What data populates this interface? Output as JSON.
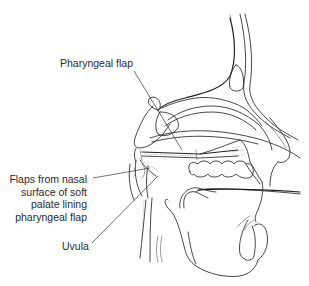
{
  "figure": {
    "labels": {
      "pharyngeal_flap": "Pharyngeal flap",
      "flaps_line1": "Flaps from nasal",
      "flaps_line2": "surface of soft",
      "flaps_line3": "palate lining",
      "flaps_line4": "pharyngeal flap",
      "uvula": "Uvula"
    },
    "colors": {
      "line": "#333333",
      "background": "#ffffff",
      "text": "#2a2a2a"
    }
  }
}
